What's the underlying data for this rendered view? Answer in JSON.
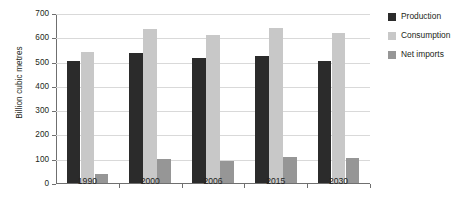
{
  "chart_data": {
    "type": "bar",
    "title": "",
    "xlabel": "",
    "ylabel": "Billion cubic metres",
    "categories": [
      "1990",
      "2000",
      "2006",
      "2015",
      "2030"
    ],
    "ylim": [
      0,
      700
    ],
    "yticks": [
      0,
      100,
      200,
      300,
      400,
      500,
      600,
      700
    ],
    "grid": true,
    "legend_position": "right",
    "series": [
      {
        "name": "Production",
        "color": "#2b2b2b",
        "values": [
          502,
          536,
          515,
          524,
          503
        ]
      },
      {
        "name": "Consumption",
        "color": "#c8c8c8",
        "values": [
          541,
          636,
          611,
          639,
          617
        ]
      },
      {
        "name": "Net imports",
        "color": "#969696",
        "values": [
          38,
          97,
          92,
          109,
          105
        ]
      }
    ]
  },
  "axis": {
    "tick_labels": [
      "0",
      "100",
      "200",
      "300",
      "400",
      "500",
      "600",
      "700"
    ]
  }
}
